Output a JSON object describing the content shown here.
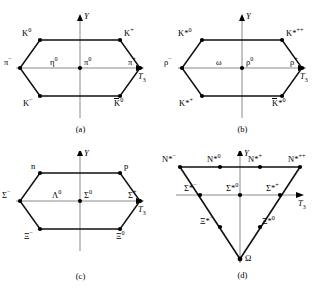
{
  "figure": {
    "axes": {
      "vertical": "Y",
      "horizontal": "T",
      "horizontal_sub": "3"
    },
    "ink_color": "#000000",
    "axis_color": "#7a7a7a"
  },
  "panels": [
    {
      "id": "a",
      "caption": "(a)",
      "shape": "hexagon",
      "name": "pseudoscalar-meson-octet",
      "vertices": [
        {
          "label": "K",
          "sup": "0",
          "bar": false,
          "pos": "top-left"
        },
        {
          "label": "K",
          "sup": "+",
          "bar": false,
          "pos": "top-right"
        },
        {
          "label": "π",
          "sup": "+",
          "bar": false,
          "pos": "right"
        },
        {
          "label": "K̅",
          "sup": "0",
          "bar": true,
          "pos": "bottom-right"
        },
        {
          "label": "K",
          "sup": "−",
          "bar": false,
          "pos": "bottom-left"
        },
        {
          "label": "π",
          "sup": "−",
          "bar": false,
          "pos": "left"
        }
      ],
      "center": [
        {
          "label": "η",
          "sup": "0"
        },
        {
          "label": "π",
          "sup": "0"
        }
      ]
    },
    {
      "id": "b",
      "caption": "(b)",
      "shape": "hexagon",
      "name": "vector-meson-nonet",
      "vertices": [
        {
          "label": "K*",
          "sup": "0",
          "bar": false,
          "pos": "top-left"
        },
        {
          "label": "K*",
          "sup": "++",
          "bar": false,
          "pos": "top-right"
        },
        {
          "label": "ρ",
          "sup": "+",
          "bar": false,
          "pos": "right"
        },
        {
          "label": "K̅*",
          "sup": "0",
          "bar": true,
          "pos": "bottom-right"
        },
        {
          "label": "K*",
          "sup": "+",
          "bar": false,
          "pos": "bottom-left"
        },
        {
          "label": "ρ",
          "sup": "−",
          "bar": false,
          "pos": "left"
        }
      ],
      "center": [
        {
          "label": "ω",
          "sup": ""
        },
        {
          "label": "ρ",
          "sup": "0"
        }
      ]
    },
    {
      "id": "c",
      "caption": "(c)",
      "shape": "hexagon",
      "name": "baryon-octet",
      "vertices": [
        {
          "label": "n",
          "sup": "",
          "bar": false,
          "pos": "top-left"
        },
        {
          "label": "p",
          "sup": "",
          "bar": false,
          "pos": "top-right"
        },
        {
          "label": "Σ",
          "sup": "+",
          "bar": false,
          "pos": "right"
        },
        {
          "label": "Ξ",
          "sup": "0",
          "bar": false,
          "pos": "bottom-right"
        },
        {
          "label": "Ξ",
          "sup": "−",
          "bar": false,
          "pos": "bottom-left"
        },
        {
          "label": "Σ",
          "sup": "−",
          "bar": false,
          "pos": "left"
        }
      ],
      "center": [
        {
          "label": "Λ",
          "sup": "0"
        },
        {
          "label": "Σ",
          "sup": "0"
        }
      ]
    },
    {
      "id": "d",
      "caption": "(d)",
      "shape": "triangle",
      "name": "baryon-decuplet",
      "rows": [
        {
          "row": "top",
          "points": [
            {
              "label": "N*",
              "sup": "−"
            },
            {
              "label": "N*",
              "sup": "0"
            },
            {
              "label": "N*",
              "sup": "+"
            },
            {
              "label": "N*",
              "sup": "++"
            }
          ]
        },
        {
          "row": "middle",
          "points": [
            {
              "label": "Σ*",
              "sup": "−"
            },
            {
              "label": "Σ*",
              "sup": "0"
            },
            {
              "label": "Σ*",
              "sup": "+"
            }
          ]
        },
        {
          "row": "lower",
          "points": [
            {
              "label": "Ξ*",
              "sup": "−"
            },
            {
              "label": "Ξ*",
              "sup": "0"
            }
          ]
        },
        {
          "row": "vertex",
          "points": [
            {
              "label": "Ω",
              "sup": ""
            }
          ]
        }
      ]
    }
  ]
}
